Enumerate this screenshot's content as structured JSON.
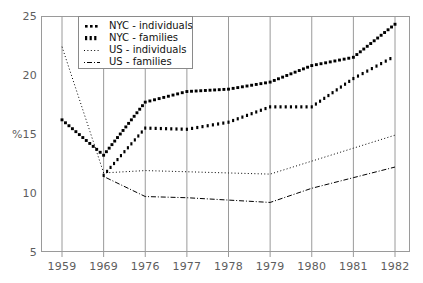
{
  "chart_data": {
    "type": "line",
    "title": "",
    "subtitle": "",
    "xlabel": "",
    "ylabel": "%",
    "categories": [
      "1959",
      "1969",
      "1976",
      "1977",
      "1978",
      "1979",
      "1980",
      "1981",
      "1982"
    ],
    "x": [
      1959,
      1969,
      1976,
      1977,
      1978,
      1979,
      1980,
      1981,
      1982
    ],
    "xlim": [
      0,
      8
    ],
    "ylim": [
      5,
      25
    ],
    "y_ticks": [
      5,
      10,
      15,
      20,
      25
    ],
    "x_ticks": [
      "1959",
      "1969",
      "1976",
      "1977",
      "1978",
      "1979",
      "1980",
      "1981",
      "1982"
    ],
    "grid": "vertical",
    "legend_position": "top-left-inside",
    "series": [
      {
        "name": "NYC - individuals",
        "style": "heavy-dotted",
        "color": "#000000",
        "values": [
          16.2,
          13.2,
          17.7,
          18.6,
          18.8,
          19.4,
          20.8,
          21.5,
          24.3
        ]
      },
      {
        "name": "NYC - families",
        "style": "heavy-dashed",
        "color": "#000000",
        "values": [
          null,
          11.5,
          15.5,
          15.4,
          16.0,
          17.3,
          17.3,
          19.7,
          21.6
        ]
      },
      {
        "name": "US - individuals",
        "style": "fine-dotted",
        "color": "#000000",
        "values": [
          22.4,
          11.7,
          11.9,
          11.8,
          11.7,
          11.6,
          12.7,
          13.8,
          14.9
        ]
      },
      {
        "name": "US - families",
        "style": "dash-dot",
        "color": "#000000",
        "values": [
          null,
          11.4,
          9.7,
          9.6,
          9.4,
          9.2,
          10.4,
          11.3,
          12.2
        ]
      }
    ]
  },
  "axes": {
    "y_label": "%",
    "y_ticks": [
      "25",
      "20",
      "15",
      "10",
      "5"
    ],
    "x_ticks": [
      "1959",
      "1969",
      "1976",
      "1977",
      "1978",
      "1979",
      "1980",
      "1981",
      "1982"
    ]
  },
  "legend": {
    "items": [
      {
        "label": "NYC - individuals",
        "marker": "heavy-dotted-marker"
      },
      {
        "label": "NYC - families",
        "marker": "heavy-dashed-marker"
      },
      {
        "label": "US - individuals",
        "marker": "fine-dotted-marker"
      },
      {
        "label": "US - families",
        "marker": "dash-dot-marker"
      }
    ]
  },
  "colors": {
    "ink": "#000000",
    "frame": "#9a9a9a",
    "grid": "#9a9a9a",
    "tick_text": "#5d5d5d"
  }
}
